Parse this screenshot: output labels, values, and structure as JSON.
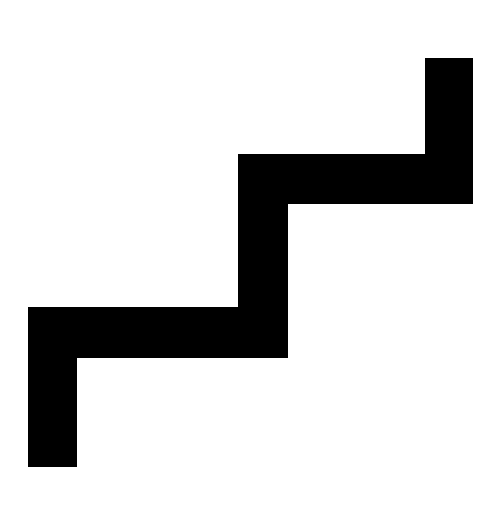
{
  "icon": {
    "name": "stairs-icon",
    "fill_color": "#000000",
    "background_color": "#ffffff",
    "points": "28,467 28,307 238,307 238,154 425,154 425,58 473,58 473,204 288,204 288,358 77,358 77,467"
  }
}
